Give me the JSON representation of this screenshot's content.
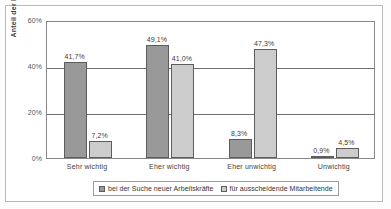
{
  "chart_data": {
    "type": "bar",
    "title": "",
    "subtitle": "",
    "xlabel": "",
    "ylabel": "Anteil der Befragten",
    "ylim": [
      0,
      60
    ],
    "yticks": [
      "0%",
      "20%",
      "40%",
      "60%"
    ],
    "ytick_values": [
      0,
      20,
      40,
      60
    ],
    "grid": true,
    "legend_position": "bottom",
    "categories": [
      "Sehr wichtig",
      "Eher wichtig",
      "Eher unwichtig",
      "Unwichtig"
    ],
    "series": [
      {
        "name": "bei der Suche neuer Arbeitskräfte",
        "color": "#999999",
        "values": [
          41.7,
          49.1,
          8.3,
          0.9
        ],
        "labels": [
          "41,7%",
          "49,1%",
          "8,3%",
          "0,9%"
        ]
      },
      {
        "name": "für ausscheidende Mitarbeitende",
        "color": "#cccccc",
        "values": [
          7.2,
          41.0,
          47.3,
          4.5
        ],
        "labels": [
          "7,2%",
          "41,0%",
          "47,3%",
          "4,5%"
        ]
      }
    ]
  }
}
